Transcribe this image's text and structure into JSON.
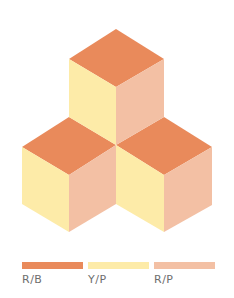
{
  "colors": {
    "top": "#E98A5B",
    "left": "#FDEBA8",
    "right": "#F3C0A4"
  },
  "cubes": [
    {
      "name": "top-cube"
    },
    {
      "name": "bottom-left-cube"
    },
    {
      "name": "bottom-right-cube"
    }
  ],
  "legend": [
    {
      "label": "R/B",
      "color": "#E98A5B"
    },
    {
      "label": "Y/P",
      "color": "#FDEBA8"
    },
    {
      "label": "R/P",
      "color": "#F3C0A4"
    }
  ]
}
